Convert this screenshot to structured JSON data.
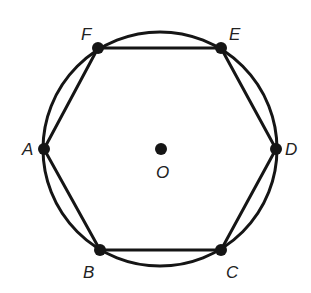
{
  "figure": {
    "circle": {
      "cx": 160,
      "cy": 149,
      "r": 117
    },
    "center": {
      "id": "O",
      "x": 161,
      "y": 149,
      "label": "O",
      "label_x": 156,
      "label_y": 178
    },
    "vertices": [
      {
        "id": "A",
        "label": "A",
        "x": 44,
        "y": 149,
        "label_x": 22,
        "label_y": 155
      },
      {
        "id": "B",
        "label": "B",
        "x": 100,
        "y": 250,
        "label_x": 83,
        "label_y": 278
      },
      {
        "id": "C",
        "label": "C",
        "x": 221,
        "y": 250,
        "label_x": 226,
        "label_y": 278
      },
      {
        "id": "D",
        "label": "D",
        "x": 276,
        "y": 149,
        "label_x": 285,
        "label_y": 155
      },
      {
        "id": "E",
        "label": "E",
        "x": 221,
        "y": 48,
        "label_x": 229,
        "label_y": 40
      },
      {
        "id": "F",
        "label": "F",
        "x": 98,
        "y": 48,
        "label_x": 81,
        "label_y": 40
      }
    ],
    "edges": [
      [
        "A",
        "B"
      ],
      [
        "B",
        "C"
      ],
      [
        "C",
        "D"
      ],
      [
        "D",
        "E"
      ],
      [
        "E",
        "F"
      ],
      [
        "F",
        "A"
      ]
    ],
    "colors": {
      "ink": "#151515",
      "label": "#222222",
      "background": "#ffffff"
    }
  }
}
